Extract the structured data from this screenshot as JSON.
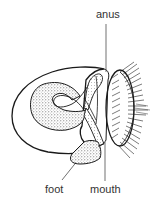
{
  "diagram": {
    "labels": {
      "anus": "anus",
      "foot": "foot",
      "mouth": "mouth"
    },
    "colors": {
      "line": "#1a1a1a",
      "stipple": "#bdbdbd",
      "background": "#ffffff"
    }
  }
}
